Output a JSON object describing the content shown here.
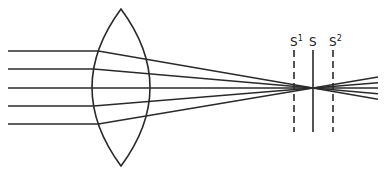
{
  "diagram": {
    "colors": {
      "stroke": "#2a2a2a",
      "background": "#ffffff"
    },
    "lens": {
      "cx": 121,
      "top": 9,
      "bottom": 166,
      "half_width": 29
    },
    "focus": {
      "x": 313,
      "y": 88
    },
    "rays_in_y": [
      51,
      69,
      88,
      106,
      124
    ],
    "ray_start_x": 8,
    "ray_end_x": 378,
    "planes": [
      {
        "id": "S1",
        "label": "S",
        "sup": "1",
        "x": 294,
        "style": "dashed"
      },
      {
        "id": "S",
        "label": "S",
        "sup": "",
        "x": 313,
        "style": "solid"
      },
      {
        "id": "S2",
        "label": "S",
        "sup": "2",
        "x": 333,
        "style": "dashed"
      }
    ],
    "plane_top": 50,
    "plane_bottom": 132
  }
}
